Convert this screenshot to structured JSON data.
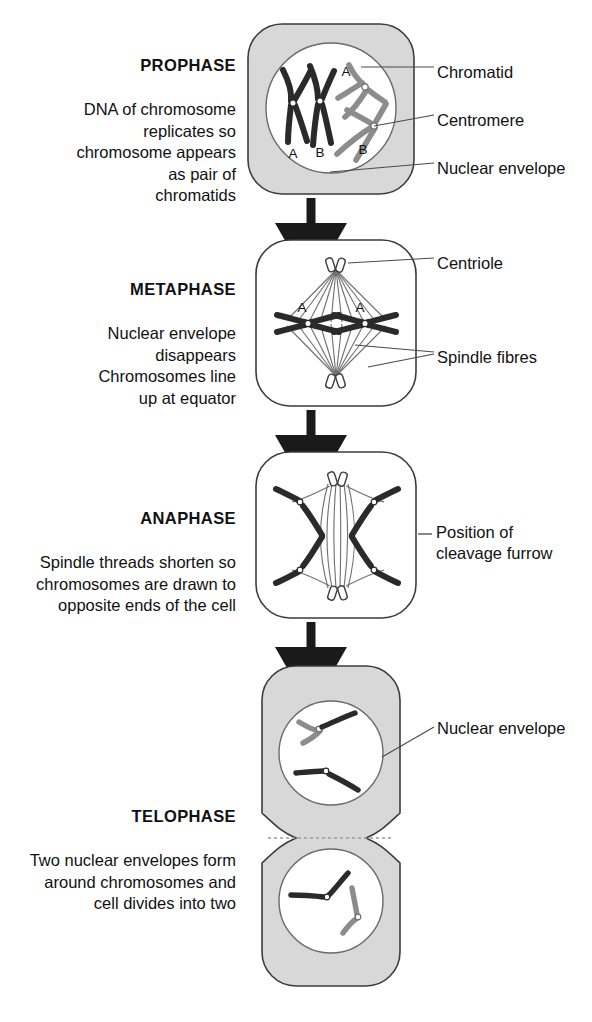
{
  "diagram": {
    "colors": {
      "cytoplasm": "#d8d8d8",
      "cytoplasm_stroke": "#3c3c3c",
      "nucleus_fill": "#ffffff",
      "nucleus_stroke": "#6b6b6b",
      "chromosome_dark": "#2a2a2a",
      "chromosome_grey": "#8c8c8c",
      "spindle_fibre": "#6e6e6e",
      "arrow": "#1a1a1a",
      "leader_line": "#4a4a4a",
      "text": "#111111",
      "cleavage_dash": "#9a9a9a"
    },
    "stages": [
      {
        "id": "prophase",
        "title": "PROPHASE",
        "body": "DNA of chromosome\nreplicates so\nchromosome appears\nas pair of\nchromatids",
        "cell_shaded": true,
        "chromosome_labels": [
          "A",
          "B",
          "A",
          "B"
        ]
      },
      {
        "id": "metaphase",
        "title": "METAPHASE",
        "body": "Nuclear envelope\ndisappears\nChromosomes line\nup at equator",
        "cell_shaded": false,
        "chromosome_labels": [
          "A",
          "A"
        ]
      },
      {
        "id": "anaphase",
        "title": "ANAPHASE",
        "body": "Spindle threads shorten so\nchromosomes are drawn to\nopposite ends of the cell",
        "cell_shaded": false,
        "chromosome_labels": []
      },
      {
        "id": "telophase",
        "title": "TELOPHASE",
        "body": "Two nuclear envelopes form\naround chromosomes and\ncell divides into two",
        "cell_shaded": true,
        "chromosome_labels": []
      }
    ],
    "annotations": [
      {
        "id": "chromatid",
        "text": "Chromatid"
      },
      {
        "id": "centromere",
        "text": "Centromere"
      },
      {
        "id": "nuclear-envelope-1",
        "text": "Nuclear envelope"
      },
      {
        "id": "centriole",
        "text": "Centriole"
      },
      {
        "id": "spindle-fibres",
        "text": "Spindle fibres"
      },
      {
        "id": "cleavage-furrow",
        "text": "Position of\ncleavage furrow"
      },
      {
        "id": "nuclear-envelope-2",
        "text": "Nuclear envelope"
      }
    ],
    "flow_arrows": 3
  }
}
